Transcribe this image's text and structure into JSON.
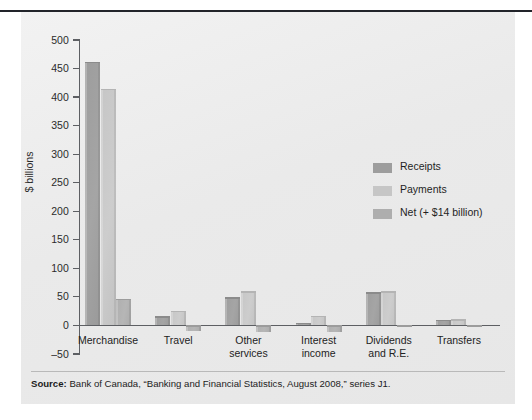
{
  "figure": {
    "ylabel": "$ billions",
    "source_prefix": "Source:",
    "source_text": " Bank of Canada, “Banking and Financial Statistics, August 2008,” series J1."
  },
  "legend": {
    "position": "inside-upper-right",
    "items": [
      {
        "label": "Receipts",
        "color": "#9d9d9d",
        "swatch_name": "legend-swatch-receipts"
      },
      {
        "label": "Payments",
        "color": "#c6c6c6",
        "swatch_name": "legend-swatch-payments"
      },
      {
        "label": "Net (+ $14 billion)",
        "color": "#aeaeae",
        "swatch_name": "legend-swatch-net"
      }
    ]
  },
  "chart_data": {
    "type": "bar",
    "title": "",
    "subtitle": "",
    "xlabel": "",
    "ylabel": "$ billions",
    "ylim": [
      -50,
      500
    ],
    "yticks": [
      500,
      450,
      400,
      350,
      300,
      250,
      200,
      150,
      100,
      50,
      0,
      -50
    ],
    "ytick_labels": [
      "500",
      "450",
      "400",
      "350",
      "300",
      "250",
      "200",
      "150",
      "100",
      "50",
      "0",
      "-50"
    ],
    "grid": false,
    "legend_position": "inside-upper-right",
    "categories": [
      "Merchandise",
      "Travel",
      "Other services",
      "Interest income",
      "Dividends and R.E.",
      "Transfers"
    ],
    "category_labels": [
      [
        "Merchandise"
      ],
      [
        "Travel"
      ],
      [
        "Other",
        "services"
      ],
      [
        "Interest",
        "income"
      ],
      [
        "Dividends",
        "and R.E."
      ],
      [
        "Transfers"
      ]
    ],
    "series": [
      {
        "name": "Receipts",
        "color": "#9d9d9d",
        "values": [
          462,
          16,
          49,
          5,
          58,
          10
        ]
      },
      {
        "name": "Payments",
        "color": "#c6c6c6",
        "values": [
          415,
          26,
          60,
          17,
          60,
          11
        ]
      },
      {
        "name": "Net (+ $14 billion)",
        "color": "#aeaeae",
        "values": [
          47,
          -10,
          -11,
          -12,
          -2,
          -1
        ]
      }
    ],
    "annotations": []
  }
}
